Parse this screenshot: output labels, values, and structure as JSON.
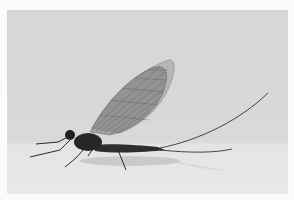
{
  "image": {
    "subject": "mayfly",
    "description": "Mayfly perched on a pale surface against a light gray background, with upright veined wings and long trailing tail filaments",
    "colors": {
      "background": "#d8d8d8",
      "surface": "#e7e7e7",
      "frame": "#fbfbfb",
      "insect_body": "#2a2a2a",
      "wing": "#8a8a8a"
    }
  }
}
